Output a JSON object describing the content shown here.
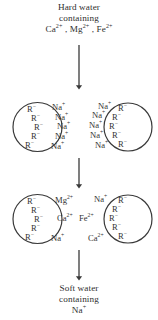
{
  "diagram": {
    "title_top": {
      "line1": "Hard water",
      "line2": "containing",
      "line3_parts": [
        {
          "base": "Ca",
          "sup": "2+"
        },
        {
          "base": ", Mg",
          "sup": "2+"
        },
        {
          "base": ", Fe",
          "sup": "2+"
        }
      ],
      "line3_text": "Ca2+ , Mg2+ , Fe2+"
    },
    "title_bottom": {
      "line1": "Soft water",
      "line2": "containing",
      "line3_base": "Na",
      "line3_sup": "+",
      "line3_text": "Na+"
    },
    "arrows": [
      {
        "name": "arrow-top",
        "direction": "down"
      },
      {
        "name": "arrow-middle",
        "direction": "down"
      },
      {
        "name": "arrow-bottom",
        "direction": "down"
      }
    ],
    "resin_stage_1": {
      "label": "sodium-loaded-resin-beads",
      "left_bead": {
        "inside_labels": [
          {
            "base": "R",
            "sup": "−"
          },
          {
            "base": "R",
            "sup": "−"
          },
          {
            "base": "R",
            "sup": "−"
          },
          {
            "base": "R",
            "sup": "−"
          },
          {
            "base": "R",
            "sup": "−"
          }
        ],
        "outside_labels": [
          {
            "base": "Na",
            "sup": "+"
          },
          {
            "base": "Na",
            "sup": "+"
          },
          {
            "base": "Na",
            "sup": "+"
          },
          {
            "base": "Na",
            "sup": "+"
          },
          {
            "base": "Na",
            "sup": "+"
          }
        ]
      },
      "right_bead": {
        "inside_labels": [
          {
            "base": "R",
            "sup": "−"
          },
          {
            "base": "R",
            "sup": "−"
          },
          {
            "base": "R",
            "sup": "−"
          },
          {
            "base": "R",
            "sup": "−"
          },
          {
            "base": "R",
            "sup": "−"
          }
        ],
        "outside_labels": [
          {
            "base": "Na",
            "sup": "+"
          },
          {
            "base": "Na",
            "sup": "+"
          },
          {
            "base": "Na",
            "sup": "+"
          },
          {
            "base": "Na",
            "sup": "+"
          },
          {
            "base": "Na",
            "sup": "+"
          }
        ]
      }
    },
    "resin_stage_2": {
      "label": "hardness-ion-exchanged-resin-beads",
      "left_bead": {
        "inside_labels": [
          {
            "base": "R",
            "sup": "−"
          },
          {
            "base": "R",
            "sup": "−"
          },
          {
            "base": "R",
            "sup": "−"
          },
          {
            "base": "R",
            "sup": "−"
          },
          {
            "base": "R",
            "sup": "−"
          }
        ],
        "outside_labels": [
          {
            "base": "Mg",
            "sup": "2+"
          },
          {
            "base": "Ca",
            "sup": "2+"
          },
          {
            "base": "Na",
            "sup": "+"
          }
        ]
      },
      "right_bead": {
        "inside_labels": [
          {
            "base": "R",
            "sup": "−"
          },
          {
            "base": "R",
            "sup": "−"
          },
          {
            "base": "R",
            "sup": "−"
          },
          {
            "base": "R",
            "sup": "−"
          },
          {
            "base": "R",
            "sup": "−"
          }
        ],
        "outside_labels": [
          {
            "base": "Na",
            "sup": "+"
          },
          {
            "base": "Fe",
            "sup": "2+"
          },
          {
            "base": "Ca",
            "sup": "2+"
          }
        ]
      }
    },
    "colors": {
      "stroke": "#3a3a3a",
      "text": "#2f2f2f",
      "background": "#ffffff"
    }
  }
}
